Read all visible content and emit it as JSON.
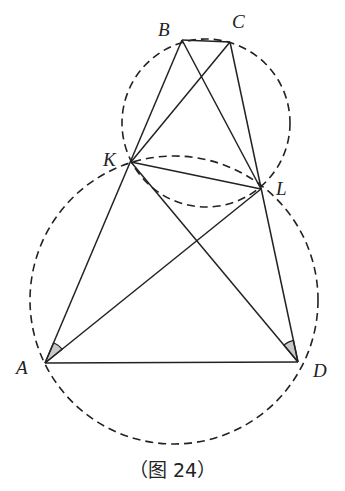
{
  "figure": {
    "caption": "（图 24）",
    "points": {
      "A": {
        "label": "A",
        "x": 45,
        "y": 363
      },
      "B": {
        "label": "B",
        "x": 182,
        "y": 40
      },
      "C": {
        "label": "C",
        "x": 230,
        "y": 42
      },
      "D": {
        "label": "D",
        "x": 298,
        "y": 362
      },
      "K": {
        "label": "K",
        "x": 131,
        "y": 162
      },
      "L": {
        "label": "L",
        "x": 261,
        "y": 189
      }
    },
    "segments": [
      [
        "A",
        "B"
      ],
      [
        "C",
        "D"
      ],
      [
        "B",
        "C"
      ],
      [
        "A",
        "D"
      ],
      [
        "K",
        "C"
      ],
      [
        "B",
        "L"
      ],
      [
        "K",
        "L"
      ],
      [
        "A",
        "L"
      ],
      [
        "K",
        "D"
      ]
    ],
    "circles": [
      {
        "name": "circle-BCLK",
        "cx": 206,
        "cy": 123,
        "r": 84,
        "style": "dashed"
      },
      {
        "name": "circle-AKLD",
        "cx": 174,
        "cy": 300,
        "r": 144,
        "style": "dashed"
      }
    ],
    "marked_angles": [
      "KAL",
      "KDL"
    ],
    "colors": {
      "stroke": "#222222",
      "angle_fill": "#c8c8c8"
    }
  }
}
